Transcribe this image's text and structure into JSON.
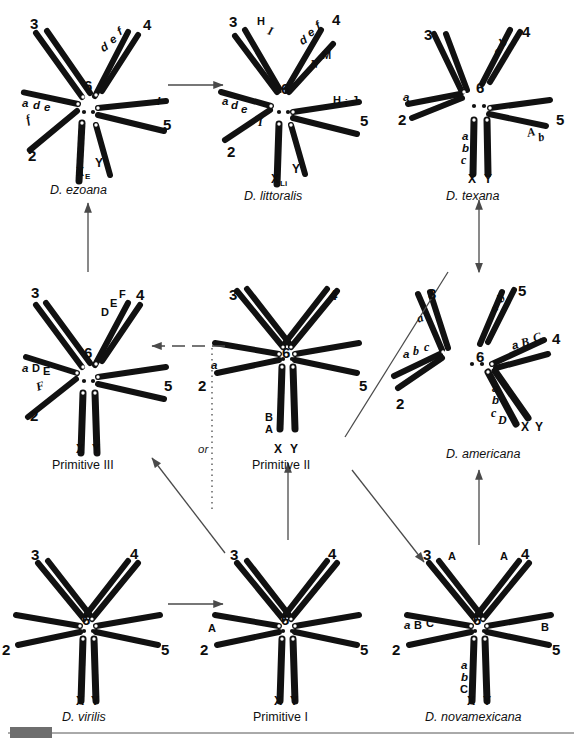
{
  "figure": {
    "kind": "karyotype-evolution-diagram",
    "ink_color": "#111111",
    "arrow_color": "#4a4a4a"
  },
  "panels": [
    {
      "id": "ezoana",
      "name": "D. ezoana",
      "name_style": "italic",
      "arm_numbers": [
        "3",
        "4",
        "2",
        "5",
        "6"
      ],
      "sex_labels": {
        "x": "X",
        "x_sub": "E",
        "y": "Y"
      },
      "band_labels": [
        "d",
        "e",
        "f",
        "a",
        "d",
        "e",
        "f",
        "I"
      ]
    },
    {
      "id": "littoralis",
      "name": "D. littoralis",
      "name_style": "italic",
      "arm_numbers": [
        "3",
        "4",
        "2",
        "5",
        "6"
      ],
      "sex_labels": {
        "x": "X",
        "x_sub": "Li",
        "y": "Y"
      },
      "band_labels": [
        "H",
        "I",
        "d",
        "e",
        "f",
        "N",
        "M",
        "a",
        "d",
        "e",
        "I",
        "H",
        "i",
        "J"
      ]
    },
    {
      "id": "texana",
      "name": "D. texana",
      "name_style": "italic",
      "arm_numbers": [
        "3",
        "4",
        "2",
        "5",
        "6"
      ],
      "sex_labels": {
        "x": "X",
        "x_sub": "",
        "y": "Y"
      },
      "band_labels": [
        "a",
        "b",
        "a",
        "A",
        "b",
        "a",
        "b",
        "c"
      ]
    },
    {
      "id": "primitive3",
      "name": "Primitive III",
      "name_style": "normal",
      "arm_numbers": [
        "3",
        "4",
        "2",
        "5",
        "6"
      ],
      "sex_labels": {
        "x": "X",
        "x_sub": "",
        "y": "Y"
      },
      "band_labels": [
        "D",
        "E",
        "F",
        "a",
        "D",
        "E",
        "F"
      ]
    },
    {
      "id": "primitive2",
      "name": "Primitive II",
      "name_style": "normal",
      "arm_numbers": [
        "3",
        "4",
        "2",
        "5",
        "6"
      ],
      "sex_labels": {
        "x": "X",
        "x_sub": "",
        "y": "Y"
      },
      "band_labels": [
        "a",
        "B",
        "A"
      ]
    },
    {
      "id": "americana",
      "name": "D. americana",
      "name_style": "italic",
      "arm_numbers": [
        "3",
        "5",
        "2",
        "4",
        "6"
      ],
      "sex_labels": {
        "x": "X",
        "x_sub": "",
        "y": "Y"
      },
      "band_labels": [
        "a",
        "b",
        "a",
        "a",
        "b",
        "c",
        "a",
        "B",
        "C",
        "a",
        "b",
        "c",
        "D"
      ]
    },
    {
      "id": "virilis",
      "name": "D. virilis",
      "name_style": "italic",
      "arm_numbers": [
        "3",
        "4",
        "2",
        "5",
        "6"
      ],
      "sex_labels": {
        "x": "X",
        "x_sub": "",
        "y": "Y"
      },
      "band_labels": []
    },
    {
      "id": "primitive1",
      "name": "Primitive I",
      "name_style": "normal",
      "arm_numbers": [
        "3",
        "4",
        "2",
        "5",
        "6"
      ],
      "sex_labels": {
        "x": "X",
        "x_sub": "",
        "y": "Y"
      },
      "band_labels": [
        "A"
      ]
    },
    {
      "id": "novamexicana",
      "name": "D. novamexicana",
      "name_style": "italic",
      "arm_numbers": [
        "3",
        "4",
        "2",
        "5",
        "6"
      ],
      "sex_labels": {
        "x": "X",
        "x_sub": "",
        "y": "Y"
      },
      "band_labels": [
        "A",
        "A",
        "a",
        "B",
        "C",
        "B",
        "a",
        "b",
        "C"
      ]
    }
  ],
  "labels": {
    "or": "or",
    "ezoana_title": "D. ezoana",
    "littoralis_title": "D. littoralis",
    "texana_title": "D. texana",
    "primitive3_title": "Primitive III",
    "primitive2_title": "Primitive II",
    "americana_title": "D. americana",
    "virilis_title": "D. virilis",
    "primitive1_title": "Primitive I",
    "novamexicana_title": "D. novamexicana",
    "n_six": "6",
    "n_two": "2",
    "n_three": "3",
    "n_four": "4",
    "n_five": "5",
    "X": "X",
    "Y": "Y",
    "sub_E": "E",
    "sub_Li": "Li",
    "A": "A",
    "B": "B",
    "C": "C",
    "D": "D",
    "E": "E",
    "F": "F",
    "H": "H",
    "I": "I",
    "J": "J",
    "M": "M",
    "N": "N",
    "a": "a",
    "b": "b",
    "c": "c",
    "d": "d",
    "e": "e",
    "f": "f",
    "i": "i"
  },
  "connections": [
    {
      "id": "ezoana-to-littoralis",
      "from": "D. ezoana",
      "to": "D. littoralis",
      "style": "solid",
      "heads": 1
    },
    {
      "id": "primitive3-to-ezoana",
      "from": "Primitive III",
      "to": "D. ezoana",
      "style": "solid",
      "heads": 1
    },
    {
      "id": "primitive2-to-primitive3",
      "from": "Primitive II",
      "to": "Primitive III",
      "style": "dashed",
      "heads": 1
    },
    {
      "id": "primitive2-to-texana",
      "from": "Primitive II",
      "to": "D. texana",
      "style": "solid",
      "heads": 0
    },
    {
      "id": "texana-americana",
      "from": "D. texana",
      "to": "D. americana",
      "style": "solid",
      "heads": 2
    },
    {
      "id": "primitive1-to-primitive2",
      "from": "Primitive I",
      "to": "Primitive II",
      "style": "solid",
      "heads": 1
    },
    {
      "id": "primitive2-to-novamexicana",
      "from": "Primitive II",
      "to": "D. novamexicana",
      "style": "solid",
      "heads": 1
    },
    {
      "id": "novamexicana-to-americana",
      "from": "D. novamexicana",
      "to": "D. americana",
      "style": "solid",
      "heads": 1
    },
    {
      "id": "virilis-to-primitive1",
      "from": "D. virilis",
      "to": "Primitive I",
      "style": "solid",
      "heads": 1
    },
    {
      "id": "or-branch-to-primitive3",
      "from": "Primitive I",
      "to": "Primitive III",
      "style": "dotted",
      "heads": 0
    },
    {
      "id": "novamexicana-to-primitive3",
      "from": "D. novamexicana",
      "to": "Primitive III",
      "style": "solid",
      "heads": 1
    }
  ]
}
